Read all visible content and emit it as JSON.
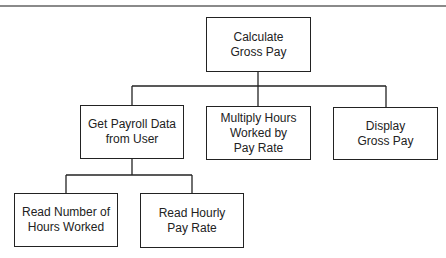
{
  "diagram": {
    "type": "hierarchy-chart",
    "root": {
      "label": "Calculate\nGross Pay"
    },
    "level2": [
      {
        "label": "Get Payroll Data\nfrom User"
      },
      {
        "label": "Multiply Hours\nWorked by\nPay Rate"
      },
      {
        "label": "Display\nGross Pay"
      }
    ],
    "level3": [
      {
        "label": "Read Number of\nHours Worked"
      },
      {
        "label": "Read Hourly\nPay Rate"
      }
    ],
    "colors": {
      "line": "#222222",
      "rule": "#8a8a8a",
      "background": "#ffffff"
    }
  }
}
